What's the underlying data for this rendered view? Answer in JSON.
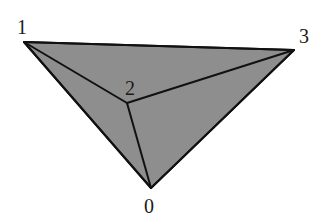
{
  "diagram": {
    "type": "tetrahedron-projection",
    "fill_color": "#8e8e8e",
    "stroke_color": "#111111",
    "vertices": [
      {
        "id": "0",
        "label": "0",
        "x": 151,
        "y": 188,
        "label_x": 149,
        "label_y": 206
      },
      {
        "id": "1",
        "label": "1",
        "x": 24,
        "y": 42,
        "label_x": 22,
        "label_y": 27
      },
      {
        "id": "2",
        "label": "2",
        "x": 127,
        "y": 103,
        "label_x": 130,
        "label_y": 88
      },
      {
        "id": "3",
        "label": "3",
        "x": 294,
        "y": 50,
        "label_x": 304,
        "label_y": 36
      }
    ],
    "edges": [
      [
        "1",
        "3"
      ],
      [
        "1",
        "0"
      ],
      [
        "3",
        "0"
      ],
      [
        "1",
        "2"
      ],
      [
        "2",
        "3"
      ],
      [
        "2",
        "0"
      ]
    ]
  }
}
